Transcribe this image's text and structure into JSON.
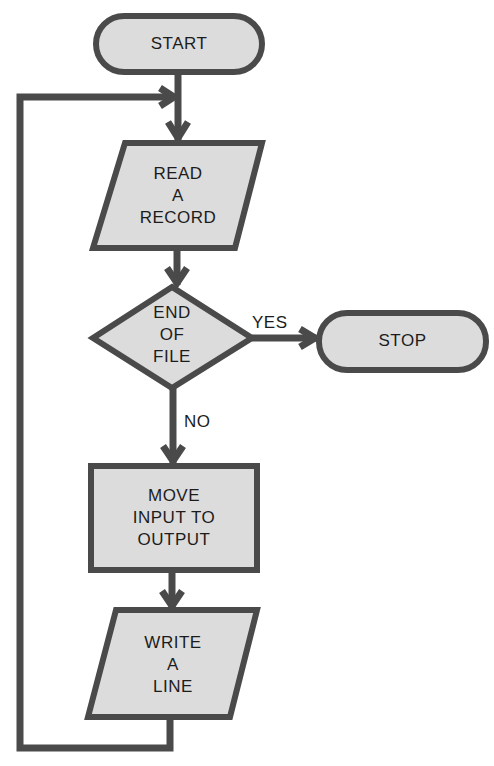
{
  "diagram": {
    "type": "flowchart",
    "colors": {
      "stroke": "#4a4a4a",
      "fill": "#dcdcdc",
      "text": "#1c1c1c",
      "background": "#ffffff"
    },
    "nodes": [
      {
        "id": "start",
        "shape": "terminal",
        "label": "START"
      },
      {
        "id": "read",
        "shape": "input-output",
        "label": "READ\nA\nRECORD"
      },
      {
        "id": "eof",
        "shape": "decision",
        "label": "END\nOF\nFILE"
      },
      {
        "id": "stop",
        "shape": "terminal",
        "label": "STOP"
      },
      {
        "id": "move",
        "shape": "process",
        "label": "MOVE\nINPUT TO\nOUTPUT"
      },
      {
        "id": "write",
        "shape": "input-output",
        "label": "WRITE\nA\nLINE"
      }
    ],
    "edges": [
      {
        "from": "start",
        "to": "read",
        "label": ""
      },
      {
        "from": "read",
        "to": "eof",
        "label": ""
      },
      {
        "from": "eof",
        "to": "stop",
        "label": "YES"
      },
      {
        "from": "eof",
        "to": "move",
        "label": "NO"
      },
      {
        "from": "move",
        "to": "write",
        "label": ""
      },
      {
        "from": "write",
        "to": "read",
        "label": "",
        "note": "loop back"
      }
    ]
  }
}
